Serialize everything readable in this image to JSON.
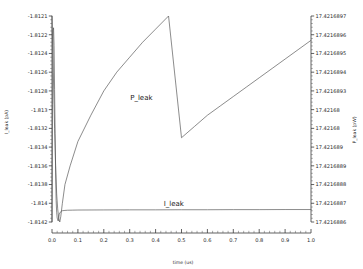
{
  "chart_data": {
    "type": "line",
    "title": "",
    "xlabel": "time (us)",
    "x_ticks": [
      "0.0",
      "0.1",
      "0.2",
      "0.3",
      "0.4",
      "0.5",
      "0.6",
      "0.7",
      "0.8",
      "0.9",
      "1.0"
    ],
    "xlim": [
      0.0,
      1.0
    ],
    "grid": false,
    "legend_position": "in-plot annotations",
    "left_axis": {
      "label": "I_leak (pA)",
      "ticks": [
        "-1.8121",
        "-1.8122",
        "-1.8124",
        "-1.8126",
        "-1.8128",
        "-1.813",
        "-1.8132",
        "-1.8134",
        "-1.8136",
        "-1.8138",
        "-1.814",
        "-1.8142"
      ],
      "ylim": [
        -1.8142,
        -1.8121
      ]
    },
    "right_axis": {
      "label": "P_leak (pW)",
      "ticks": [
        "17.4216897",
        "17.4216896",
        "17.4216895",
        "17.4216894",
        "17.4216893",
        "17.42168",
        "17.42168",
        "17.421689",
        "17.4216889",
        "17.4216888",
        "17.4216887",
        "17.4216886"
      ],
      "ylim": [
        17.4216886,
        17.4216897
      ]
    },
    "series": [
      {
        "name": "I_leak",
        "axis": "left",
        "annotation": "I_leak",
        "annotation_x": 0.47,
        "annotation_y": -1.81404,
        "x": [
          0.0,
          0.002,
          0.004,
          0.006,
          0.008,
          0.01,
          0.012,
          0.014,
          0.016,
          0.018,
          0.02,
          0.024,
          0.028,
          0.032,
          0.036,
          0.04,
          0.05,
          0.06,
          0.08,
          0.1,
          0.2,
          0.3,
          0.4,
          0.5,
          0.6,
          0.7,
          0.8,
          0.9,
          1.0
        ],
        "y": [
          -1.8142,
          -1.813,
          -1.81225,
          -1.81222,
          -1.8124,
          -1.81285,
          -1.8133,
          -1.8137,
          -1.81398,
          -1.8141,
          -1.81416,
          -1.81419,
          -1.81412,
          -1.8141,
          -1.81409,
          -1.814085,
          -1.814082,
          -1.81408,
          -1.814079,
          -1.814078,
          -1.814077,
          -1.814076,
          -1.814076,
          -1.814075,
          -1.814075,
          -1.814074,
          -1.814074,
          -1.814073,
          -1.814073
        ]
      },
      {
        "name": "P_leak",
        "axis": "right",
        "annotation": "P_leak",
        "annotation_x": 0.345,
        "annotation_y": 17.42168925,
        "x": [
          0.0,
          0.005,
          0.01,
          0.014,
          0.018,
          0.022,
          0.026,
          0.03,
          0.034,
          0.04,
          0.05,
          0.07,
          0.1,
          0.15,
          0.2,
          0.25,
          0.3,
          0.35,
          0.4,
          0.45,
          0.5,
          0.55,
          0.6,
          0.65,
          0.7,
          0.75,
          0.8,
          0.85,
          0.9,
          0.95,
          1.0
        ],
        "y": [
          17.4216897,
          17.4216894,
          17.4216891,
          17.4216889,
          17.42168875,
          17.42168867,
          17.42168862,
          17.4216886,
          17.42168863,
          17.4216887,
          17.4216888,
          17.4216889,
          17.42168903,
          17.42168917,
          17.4216893,
          17.4216894,
          17.42168948,
          17.42168956,
          17.42168963,
          17.4216897,
          17.42168905,
          17.42168911,
          17.42168917,
          17.42168922,
          17.42168927,
          17.42168932,
          17.42168937,
          17.42168942,
          17.42168947,
          17.42168952,
          17.42168957
        ]
      }
    ]
  }
}
